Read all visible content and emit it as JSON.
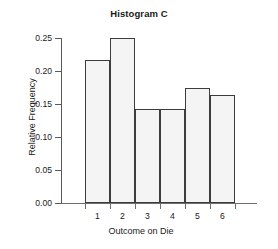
{
  "chart_data": {
    "type": "bar",
    "title": "Histogram C",
    "xlabel": "Outcome on Die",
    "ylabel": "Relative Frequency",
    "categories": [
      "1",
      "2",
      "3",
      "4",
      "5",
      "6"
    ],
    "values": [
      0.217,
      0.25,
      0.143,
      0.143,
      0.175,
      0.164
    ],
    "ylim": [
      0.0,
      0.25
    ],
    "ytick_labels": [
      "0.00",
      "0.05",
      "0.10",
      "0.15",
      "0.20",
      "0.25"
    ],
    "ytick_values": [
      0.0,
      0.05,
      0.1,
      0.15,
      0.2,
      0.25
    ],
    "grid": false,
    "legend": "none",
    "bar_fill_color": "#f4f4f4",
    "bar_border_color": "#3c3c3c",
    "axis_color": "#5a5a5a",
    "background_color": "#ffffff",
    "bars_adjacent": true
  }
}
